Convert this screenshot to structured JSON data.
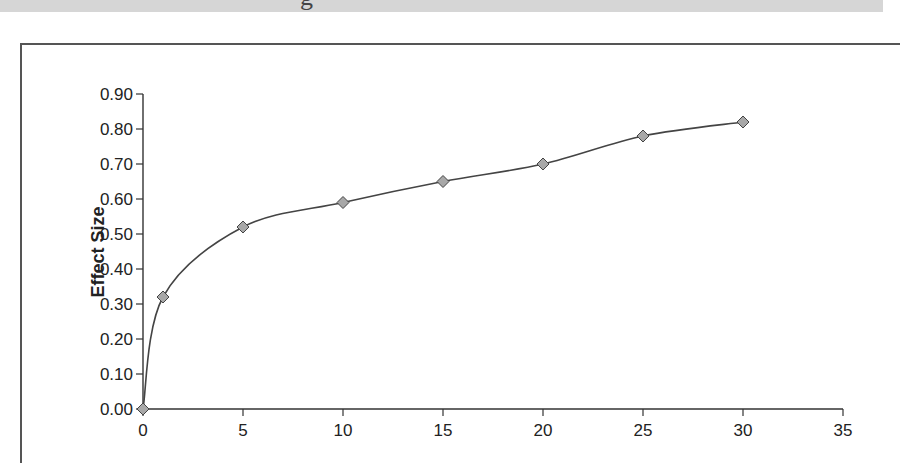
{
  "banner": {
    "partial_text": "g"
  },
  "chart_data": {
    "type": "line",
    "title": "",
    "xlabel": "",
    "ylabel": "Effect Size",
    "x": [
      0,
      1,
      5,
      10,
      15,
      20,
      25,
      30
    ],
    "series": [
      {
        "name": "Effect Size",
        "values": [
          0.0,
          0.32,
          0.52,
          0.59,
          0.65,
          0.7,
          0.78,
          0.82
        ]
      }
    ],
    "xlim": [
      0,
      35
    ],
    "ylim": [
      0.0,
      0.9
    ],
    "x_ticks": [
      "0",
      "5",
      "10",
      "15",
      "20",
      "25",
      "30",
      "35"
    ],
    "y_ticks": [
      "0.00",
      "0.10",
      "0.20",
      "0.30",
      "0.40",
      "0.50",
      "0.60",
      "0.70",
      "0.80",
      "0.90"
    ],
    "grid": false,
    "legend": "none",
    "marker": "diamond",
    "smoothed": true
  },
  "colors": {
    "line": "#444444",
    "marker_fill": "#a8a8a8",
    "marker_stroke": "#444444",
    "axis": "#333333",
    "frame": "#555555",
    "banner": "#d6d6d6"
  }
}
